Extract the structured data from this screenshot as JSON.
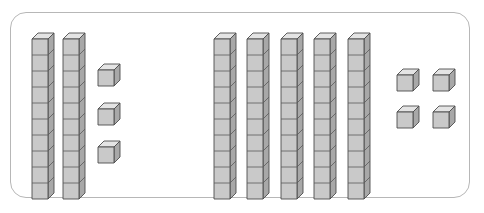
{
  "figure": {
    "kind": "base-ten-blocks",
    "frame": {
      "shape": "rounded-rectangle",
      "border_color": "#b7b7b7",
      "background": "#ffffff"
    },
    "block_colors": {
      "front_face": "#c9c9c9",
      "top_face": "#e4e4e4",
      "right_face": "#a8a8a8",
      "outline": "#4d4d4d"
    },
    "unit_cube_size_px": 16,
    "rod_segments": 10
  },
  "groups": [
    {
      "id": "left-group",
      "name": "left-number",
      "tens_rods": 2,
      "unit_cubes": 3,
      "tens_value": 20,
      "ones_value": 3,
      "total": 23,
      "rods": [
        {
          "x": 31,
          "y": 32,
          "segments": 10
        },
        {
          "x": 62,
          "y": 32,
          "segments": 10
        }
      ],
      "cubes": [
        {
          "x": 97,
          "y": 63
        },
        {
          "x": 97,
          "y": 102
        },
        {
          "x": 97,
          "y": 140
        }
      ]
    },
    {
      "id": "right-group",
      "name": "right-number",
      "tens_rods": 5,
      "unit_cubes": 4,
      "tens_value": 50,
      "ones_value": 4,
      "total": 54,
      "rods": [
        {
          "x": 213,
          "y": 32,
          "segments": 10
        },
        {
          "x": 246,
          "y": 32,
          "segments": 10
        },
        {
          "x": 280,
          "y": 32,
          "segments": 10
        },
        {
          "x": 313,
          "y": 32,
          "segments": 10
        },
        {
          "x": 347,
          "y": 32,
          "segments": 10
        }
      ],
      "cubes": [
        {
          "x": 396,
          "y": 68
        },
        {
          "x": 432,
          "y": 68
        },
        {
          "x": 396,
          "y": 105
        },
        {
          "x": 432,
          "y": 105
        }
      ]
    }
  ],
  "chart_data": {
    "type": "table",
    "title": "",
    "categories": [
      "left-group",
      "right-group"
    ],
    "series": [
      {
        "name": "tens rods",
        "values": [
          2,
          5
        ]
      },
      {
        "name": "unit cubes",
        "values": [
          3,
          4
        ]
      },
      {
        "name": "total value",
        "values": [
          23,
          54
        ]
      }
    ]
  }
}
